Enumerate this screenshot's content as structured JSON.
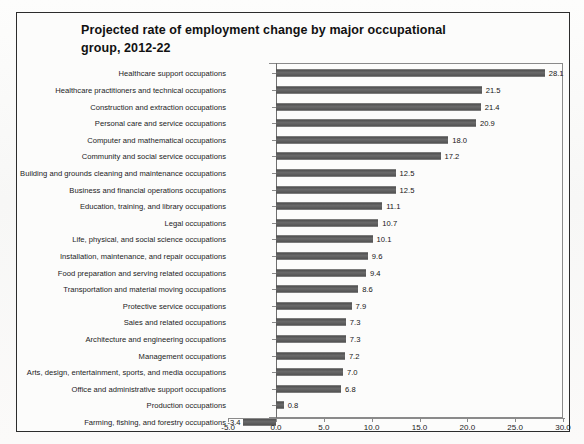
{
  "chart_data": {
    "type": "bar",
    "orientation": "horizontal",
    "title": "Projected rate of employment change by major occupational group, 2012-22",
    "title_line1": "Projected rate of employment change by major occupational",
    "title_line2": "group, 2012-22",
    "xlabel": "",
    "ylabel": "",
    "xlim": [
      -5.0,
      30.0
    ],
    "xticks": [
      "-5.0",
      "0.0",
      "5.0",
      "10.0",
      "15.0",
      "20.0",
      "25.0",
      "30.0"
    ],
    "xtick_values": [
      -5.0,
      0.0,
      5.0,
      10.0,
      15.0,
      20.0,
      25.0,
      30.0
    ],
    "grid": false,
    "legend": "none",
    "bar_color": "#585858",
    "categories": [
      "Healthcare support occupations",
      "Healthcare practitioners and technical occupations",
      "Construction and extraction occupations",
      "Personal care and service occupations",
      "Computer and mathematical occupations",
      "Community and social service occupations",
      "Building and grounds cleaning and maintenance occupations",
      "Business and financial operations occupations",
      "Education, training, and library occupations",
      "Legal occupations",
      "Life, physical, and social science occupations",
      "Installation, maintenance, and repair occupations",
      "Food preparation and serving related occupations",
      "Transportation and material moving occupations",
      "Protective service occupations",
      "Sales and related occupations",
      "Architecture and engineering occupations",
      "Management occupations",
      "Arts, design, entertainment, sports, and media occupations",
      "Office and administrative support occupations",
      "Production occupations",
      "Farming, fishing, and forestry occupations"
    ],
    "values": [
      28.1,
      21.5,
      21.4,
      20.9,
      18.0,
      17.2,
      12.5,
      12.5,
      11.1,
      10.7,
      10.1,
      9.6,
      9.4,
      8.6,
      7.9,
      7.3,
      7.3,
      7.2,
      7.0,
      6.8,
      0.8,
      -3.4
    ],
    "value_labels": [
      "28.1",
      "21.5",
      "21.4",
      "20.9",
      "18.0",
      "17.2",
      "12.5",
      "12.5",
      "11.1",
      "10.7",
      "10.1",
      "9.6",
      "9.4",
      "8.6",
      "7.9",
      "7.3",
      "7.3",
      "7.2",
      "7.0",
      "6.8",
      "0.8",
      "-3.4"
    ]
  }
}
